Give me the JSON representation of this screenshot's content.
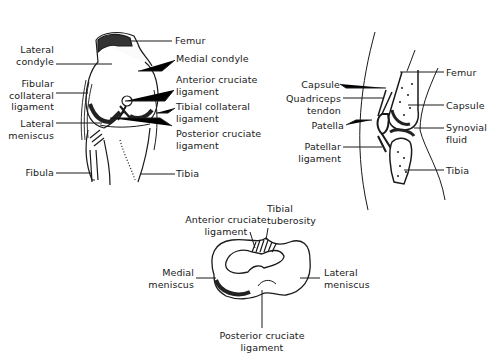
{
  "front_view": {
    "labels": {
      "femur": "Femur",
      "lateral_condyle": [
        "Lateral",
        "condyle"
      ],
      "medial_condyle": "Medial condyle",
      "anterior_cruciate": [
        "Anterior cruciate",
        "ligament"
      ],
      "fibular_collateral": [
        "Fibular",
        "collateral",
        "ligament"
      ],
      "tibial_collateral": [
        "Tibial collateral",
        "ligament"
      ],
      "lateral_meniscus": [
        "Lateral",
        "meniscus"
      ],
      "posterior_cruciate": [
        "Posterior cruciate",
        "ligament"
      ],
      "fibula": "Fibula",
      "tibia": "Tibia"
    }
  },
  "sagittal_view": {
    "labels": {
      "capsule_left": "Capsule",
      "quadriceps_tendon": [
        "Quadriceps",
        "tendon"
      ],
      "patella": "Patella",
      "patellar_ligament": [
        "Patellar",
        "ligament"
      ],
      "femur": "Femur",
      "capsule_right": "Capsule",
      "synovial_fluid": [
        "Synovial",
        "fluid"
      ],
      "tibia": "Tibia"
    }
  },
  "top_view": {
    "labels": {
      "anterior_cruciate": [
        "Anterior cruciate",
        "ligament"
      ],
      "tibial_tuberosity": [
        "Tibial",
        "tuberosity"
      ],
      "medial_meniscus": [
        "Medial",
        "meniscus"
      ],
      "lateral_meniscus": [
        "Lateral",
        "meniscus"
      ],
      "posterior_cruciate": [
        "Posterior cruciate",
        "ligament"
      ]
    }
  },
  "colors": {
    "ink": "#1a1a1a",
    "background": "#ffffff"
  }
}
